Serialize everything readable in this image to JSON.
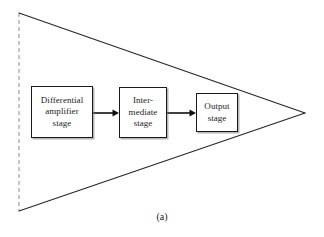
{
  "figure": {
    "caption": "(a)",
    "background_color": "#ffffff",
    "line_color": "#1a1a1a",
    "text_color": "#1c1c1c",
    "boundary": {
      "type": "triangle",
      "description": "op-amp triangle symbol opening to the right",
      "left_edge_style": "dashed",
      "vertices": [
        [
          19,
          13
        ],
        [
          305,
          113
        ],
        [
          19,
          211
        ]
      ]
    },
    "blocks": [
      {
        "id": "differential-amplifier-stage",
        "label": "Differential\namplifier\nstage",
        "x": 31,
        "y": 86,
        "width": 62,
        "height": 52
      },
      {
        "id": "intermediate-stage",
        "label": "Inter-\nmediate\nstage",
        "x": 119,
        "y": 87,
        "width": 48,
        "height": 51
      },
      {
        "id": "output-stage",
        "label": "Output\nstage",
        "x": 196,
        "y": 93,
        "width": 42,
        "height": 39
      }
    ],
    "connectors": [
      {
        "id": "arrow-diff-to-inter",
        "from": "differential-amplifier-stage",
        "to": "intermediate-stage",
        "x1": 93,
        "x2": 119,
        "y": 113
      },
      {
        "id": "arrow-inter-to-output",
        "from": "intermediate-stage",
        "to": "output-stage",
        "x1": 167,
        "x2": 196,
        "y": 113
      }
    ]
  }
}
